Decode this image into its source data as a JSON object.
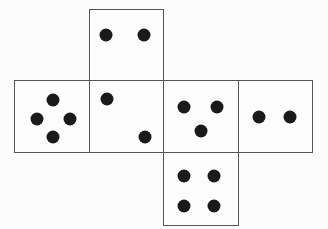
{
  "colors": {
    "line": "#555555",
    "dot": "#1a1a1a",
    "background": "#fcfcfc"
  },
  "faces": [
    {
      "id": "top",
      "pips": 2,
      "x": 89,
      "y": 9,
      "w": 75,
      "h": 72,
      "dots": [
        [
          16,
          25
        ],
        [
          54,
          25
        ]
      ]
    },
    {
      "id": "left",
      "pips": 4,
      "x": 14,
      "y": 80,
      "w": 76,
      "h": 73,
      "dots": [
        [
          38,
          19
        ],
        [
          22,
          38
        ],
        [
          55,
          38
        ],
        [
          38,
          56
        ]
      ]
    },
    {
      "id": "center-left",
      "pips": 2,
      "x": 89,
      "y": 80,
      "w": 75,
      "h": 73,
      "dots": [
        [
          17,
          18
        ],
        [
          55,
          56
        ]
      ]
    },
    {
      "id": "center-right",
      "pips": 3,
      "x": 163,
      "y": 80,
      "w": 76,
      "h": 73,
      "dots": [
        [
          20,
          26
        ],
        [
          53,
          26
        ],
        [
          37,
          50
        ]
      ]
    },
    {
      "id": "right",
      "pips": 2,
      "x": 238,
      "y": 80,
      "w": 75,
      "h": 73,
      "dots": [
        [
          20,
          36
        ],
        [
          51,
          36
        ]
      ]
    },
    {
      "id": "bottom",
      "pips": 4,
      "x": 163,
      "y": 152,
      "w": 76,
      "h": 74,
      "dots": [
        [
          20,
          23
        ],
        [
          50,
          23
        ],
        [
          20,
          53
        ],
        [
          50,
          53
        ]
      ]
    }
  ]
}
